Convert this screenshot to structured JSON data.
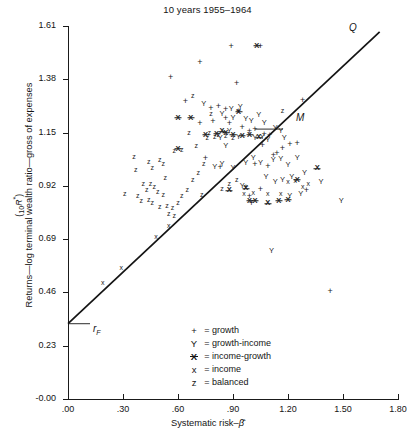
{
  "chart_data": {
    "type": "scatter",
    "title": "10 years 1955–1964",
    "xlabel": "Systematic risk–β̂",
    "ylabel": "Returns—log terminal wealth ratio—gross of expenses",
    "ylabel_units": "(10R*)",
    "xlim": [
      0.0,
      1.8
    ],
    "ylim": [
      0.0,
      1.61
    ],
    "grid": false,
    "xticks": [
      ".00",
      ".30",
      ".60",
      ".90",
      "1.20",
      "1.50",
      "1.80"
    ],
    "xtick_values": [
      0.0,
      0.3,
      0.6,
      0.9,
      1.2,
      1.5,
      1.8
    ],
    "yticks": [
      "1.61",
      "1.38",
      "1.15",
      "0.92",
      "0.69",
      "0.46",
      "0.23",
      "-0.00"
    ],
    "ytick_values": [
      1.61,
      1.38,
      1.15,
      0.92,
      0.69,
      0.46,
      0.23,
      0.0
    ],
    "legend_position": "lower-center",
    "legend": [
      {
        "symbol": "+",
        "glyph": "plus",
        "label": "growth"
      },
      {
        "symbol": "Y",
        "glyph": "Y",
        "label": "growth-income"
      },
      {
        "symbol": "X̶",
        "glyph": "Xbar",
        "label": "income-growth"
      },
      {
        "symbol": "x",
        "glyph": "x",
        "label": "income"
      },
      {
        "symbol": "z",
        "glyph": "z",
        "label": "balanced"
      }
    ],
    "annotations": [
      {
        "name": "market-line-endpoint",
        "text": "Q",
        "x": 1.73,
        "y": 1.6
      },
      {
        "name": "market-portfolio",
        "text": "M",
        "x": 1.02,
        "y": 1.165
      },
      {
        "name": "riskfree-rate",
        "text": "rF",
        "x": 0.0,
        "y": 0.325
      }
    ],
    "line": {
      "name": "market-line",
      "from": {
        "x": 0.0,
        "y": 0.325
      },
      "to": {
        "x": 1.7,
        "y": 1.585
      }
    },
    "series": [
      {
        "name": "growth",
        "marker": "plus",
        "points": [
          [
            0.72,
            1.455
          ],
          [
            0.89,
            1.525
          ],
          [
            1.05,
            1.525
          ],
          [
            0.56,
            1.39
          ],
          [
            0.78,
            1.255
          ],
          [
            0.82,
            1.265
          ],
          [
            0.86,
            1.25
          ],
          [
            0.93,
            1.245
          ],
          [
            1.28,
            1.29
          ],
          [
            0.72,
            1.19
          ],
          [
            0.79,
            1.2
          ],
          [
            0.86,
            1.215
          ],
          [
            0.88,
            1.19
          ],
          [
            0.95,
            1.175
          ],
          [
            0.99,
            1.155
          ],
          [
            1.02,
            1.165
          ],
          [
            1.07,
            1.145
          ],
          [
            1.1,
            1.14
          ],
          [
            0.75,
            1.04
          ],
          [
            0.83,
            1.0
          ],
          [
            1.06,
            1.095
          ],
          [
            1.12,
            1.055
          ],
          [
            1.14,
            1.06
          ],
          [
            1.17,
            1.085
          ],
          [
            1.21,
            1.1
          ],
          [
            1.25,
            1.105
          ],
          [
            1.02,
            1.015
          ],
          [
            1.09,
            1.005
          ],
          [
            0.97,
            0.915
          ],
          [
            0.99,
            0.875
          ],
          [
            1.0,
            0.845
          ],
          [
            1.05,
            0.905
          ],
          [
            1.43,
            0.465
          ],
          [
            1.3,
            0.9
          ],
          [
            0.92,
            1.365
          ],
          [
            0.64,
            1.285
          ]
        ]
      },
      {
        "name": "growth-income",
        "marker": "Y",
        "points": [
          [
            0.74,
            1.275
          ],
          [
            0.84,
            1.23
          ],
          [
            0.89,
            1.25
          ],
          [
            0.94,
            1.26
          ],
          [
            0.9,
            1.215
          ],
          [
            0.97,
            1.21
          ],
          [
            1.0,
            1.2
          ],
          [
            1.04,
            1.225
          ],
          [
            1.07,
            1.19
          ],
          [
            1.13,
            1.17
          ],
          [
            1.16,
            1.155
          ],
          [
            1.18,
            1.125
          ],
          [
            0.83,
            1.125
          ],
          [
            0.86,
            1.09
          ],
          [
            0.93,
            1.13
          ],
          [
            1.02,
            1.125
          ],
          [
            1.06,
            1.13
          ],
          [
            1.09,
            1.12
          ],
          [
            0.8,
            1.0
          ],
          [
            0.84,
            1.015
          ],
          [
            0.9,
            0.995
          ],
          [
            0.97,
            1.02
          ],
          [
            1.01,
            1.04
          ],
          [
            1.05,
            1.02
          ],
          [
            1.12,
            1.03
          ],
          [
            1.16,
            1.035
          ],
          [
            1.2,
            1.01
          ],
          [
            1.25,
            1.04
          ],
          [
            1.08,
            0.96
          ],
          [
            1.13,
            0.935
          ],
          [
            1.17,
            0.945
          ],
          [
            1.22,
            0.96
          ],
          [
            1.29,
            0.975
          ],
          [
            1.38,
            0.935
          ],
          [
            1.49,
            0.855
          ],
          [
            1.21,
            0.875
          ],
          [
            1.27,
            0.885
          ],
          [
            0.95,
            0.92
          ],
          [
            0.88,
            1.155
          ],
          [
            1.11,
            0.64
          ]
        ]
      },
      {
        "name": "income-growth",
        "marker": "Xbar",
        "points": [
          [
            0.6,
            1.215
          ],
          [
            0.67,
            1.215
          ],
          [
            0.75,
            1.14
          ],
          [
            0.81,
            1.145
          ],
          [
            0.84,
            1.155
          ],
          [
            0.86,
            1.15
          ],
          [
            0.9,
            1.14
          ],
          [
            0.95,
            1.135
          ],
          [
            0.99,
            1.14
          ],
          [
            1.04,
            1.13
          ],
          [
            0.6,
            1.08
          ],
          [
            0.93,
            1.24
          ],
          [
            1.03,
            1.525
          ],
          [
            0.99,
            0.855
          ],
          [
            1.02,
            0.855
          ],
          [
            1.09,
            0.845
          ],
          [
            1.15,
            0.855
          ],
          [
            1.2,
            0.86
          ],
          [
            1.25,
            0.945
          ],
          [
            0.97,
            0.91
          ],
          [
            0.88,
            0.9
          ],
          [
            1.36,
            0.995
          ]
        ]
      },
      {
        "name": "income",
        "marker": "x",
        "points": [
          [
            0.19,
            0.5
          ],
          [
            0.29,
            0.565
          ],
          [
            0.55,
            0.745
          ],
          [
            0.48,
            0.7
          ],
          [
            1.2,
            0.935
          ],
          [
            1.24,
            0.94
          ],
          [
            1.16,
            0.885
          ],
          [
            1.09,
            0.885
          ],
          [
            0.96,
            0.885
          ],
          [
            1.01,
            0.89
          ],
          [
            1.31,
            0.93
          ],
          [
            1.28,
            0.915
          ]
        ]
      },
      {
        "name": "balanced",
        "marker": "z",
        "points": [
          [
            0.44,
            1.025
          ],
          [
            0.5,
            1.03
          ],
          [
            0.52,
            1.015
          ],
          [
            0.46,
            0.995
          ],
          [
            0.37,
            0.99
          ],
          [
            0.53,
            0.955
          ],
          [
            0.41,
            0.93
          ],
          [
            0.45,
            0.93
          ],
          [
            0.47,
            0.915
          ],
          [
            0.43,
            0.9
          ],
          [
            0.49,
            0.895
          ],
          [
            0.31,
            0.885
          ],
          [
            0.38,
            0.875
          ],
          [
            0.4,
            0.855
          ],
          [
            0.44,
            0.86
          ],
          [
            0.46,
            0.845
          ],
          [
            0.5,
            0.83
          ],
          [
            0.54,
            0.835
          ],
          [
            0.57,
            0.825
          ],
          [
            0.6,
            0.845
          ],
          [
            0.62,
            0.875
          ],
          [
            0.65,
            0.9
          ],
          [
            0.58,
            0.79
          ],
          [
            0.55,
            0.8
          ],
          [
            0.68,
            0.945
          ],
          [
            0.71,
            0.975
          ],
          [
            0.74,
            1.015
          ],
          [
            0.7,
            1.09
          ],
          [
            0.76,
            1.125
          ],
          [
            0.8,
            1.13
          ],
          [
            0.82,
            1.14
          ],
          [
            0.86,
            1.135
          ],
          [
            0.9,
            1.125
          ],
          [
            0.66,
            1.15
          ],
          [
            0.78,
            1.23
          ],
          [
            0.68,
            1.31
          ],
          [
            0.77,
            1.15
          ],
          [
            0.84,
            0.905
          ],
          [
            0.88,
            0.93
          ],
          [
            0.92,
            0.945
          ],
          [
            0.73,
            0.88
          ],
          [
            0.62,
            1.075
          ],
          [
            0.52,
            0.88
          ],
          [
            0.58,
            1.07
          ],
          [
            1.17,
            1.245
          ],
          [
            0.36,
            1.045
          ]
        ]
      }
    ]
  }
}
